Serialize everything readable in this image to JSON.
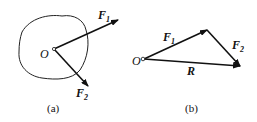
{
  "figure_a": {
    "point_label": "O",
    "force1": {
      "symbol": "F",
      "sub": "1"
    },
    "force2": {
      "symbol": "F",
      "sub": "2"
    },
    "caption": "(a)"
  },
  "figure_b": {
    "point_label": "O",
    "force1": {
      "symbol": "F",
      "sub": "1"
    },
    "force2": {
      "symbol": "F",
      "sub": "2"
    },
    "resultant": "R",
    "caption": "(b)"
  },
  "colors": {
    "ink": "#111111",
    "background": "#ffffff"
  }
}
